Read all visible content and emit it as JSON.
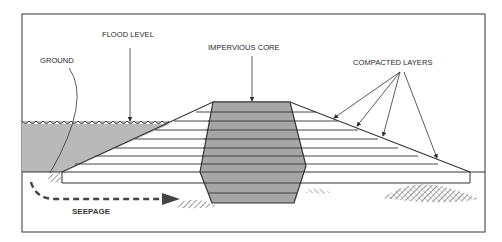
{
  "diagram": {
    "type": "levee-cross-section",
    "labels": {
      "flood_level": "FLOOD LEVEL",
      "ground": "GROUND",
      "impervious_core": "IMPERVIOUS CORE",
      "compacted_layers": "COMPACTED LAYERS",
      "seepage": "SEEPAGE"
    },
    "colors": {
      "frame": "#555555",
      "water": "#b9b9b9",
      "core": "#a6a6a6",
      "lines": "#333333",
      "background": "#ffffff"
    },
    "layer_count": 8
  }
}
